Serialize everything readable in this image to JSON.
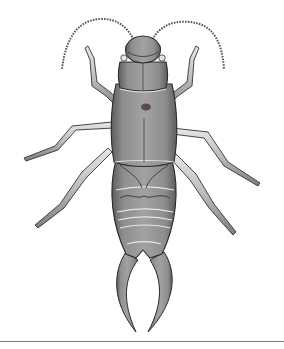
{
  "image": {
    "subject": "earwig",
    "style": "monochrome engraving illustration",
    "caption": "Earwig illustration",
    "colors": {
      "background": "#ffffff",
      "body_fill": "#9a9a9a",
      "body_shadow": "#6e6e6e",
      "outline": "#2a2a2a",
      "leg_fill": "#c4c4c4",
      "highlight": "#e6e6e6",
      "rule": "#7a7a7a"
    }
  }
}
